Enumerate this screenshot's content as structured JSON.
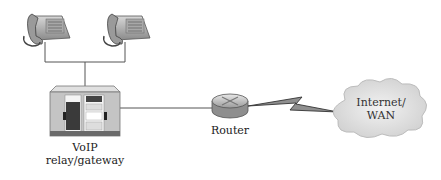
{
  "diagram": {
    "type": "network-topology",
    "nodes": [
      {
        "id": "phone1",
        "kind": "telephone",
        "icon": "telephone-icon"
      },
      {
        "id": "phone2",
        "kind": "telephone",
        "icon": "telephone-icon"
      },
      {
        "id": "gateway",
        "kind": "voip-gateway",
        "icon": "server-rack-icon",
        "label_line1": "VoIP",
        "label_line2": "relay/gateway"
      },
      {
        "id": "router",
        "kind": "router",
        "icon": "router-icon",
        "label": "Router"
      },
      {
        "id": "cloud",
        "kind": "network-cloud",
        "icon": "cloud-icon",
        "label_line1": "Internet/",
        "label_line2": "WAN"
      }
    ],
    "edges": [
      {
        "from": "phone1",
        "to": "gateway",
        "style": "line"
      },
      {
        "from": "phone2",
        "to": "gateway",
        "style": "line"
      },
      {
        "from": "gateway",
        "to": "router",
        "style": "line"
      },
      {
        "from": "router",
        "to": "cloud",
        "style": "lightning-bolt"
      }
    ],
    "colors": {
      "line": "#555555",
      "device_gray": "#b8b8b8",
      "cloud_fill": "#e4e4e4"
    }
  }
}
